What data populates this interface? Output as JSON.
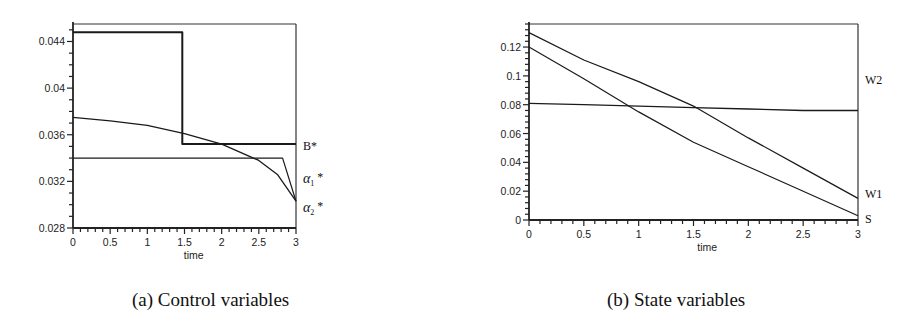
{
  "figures": {
    "a": {
      "caption": "(a) Control variables"
    },
    "b": {
      "caption": "(b) State variables"
    }
  },
  "chart_data": [
    {
      "type": "line",
      "title": "(a) Control variables",
      "xlabel": "time",
      "ylabel": "",
      "xlim": [
        0,
        3
      ],
      "ylim": [
        0.028,
        0.0455
      ],
      "xticks": [
        "0",
        "0.5",
        "1",
        "1.5",
        "2",
        "2.5",
        "3"
      ],
      "yticks": [
        "0.028",
        "0.032",
        "0.036",
        "0.04",
        "0.044"
      ],
      "grid": false,
      "legend_position": "inline-right",
      "series": [
        {
          "name": "B*",
          "label": "B*",
          "x": [
            0,
            1.47,
            1.47,
            3
          ],
          "values": [
            0.0448,
            0.0448,
            0.0352,
            0.0352
          ]
        },
        {
          "name": "α1*",
          "label": "α1 *",
          "x": [
            0,
            0.5,
            1,
            1.5,
            2,
            2.5,
            2.82,
            3
          ],
          "values": [
            0.034,
            0.034,
            0.034,
            0.034,
            0.034,
            0.034,
            0.034,
            0.0303
          ]
        },
        {
          "name": "α2*",
          "label": "α2 *",
          "x": [
            0,
            0.5,
            1,
            1.5,
            2,
            2.5,
            2.75,
            3
          ],
          "values": [
            0.0375,
            0.0372,
            0.0368,
            0.0361,
            0.0352,
            0.0338,
            0.0326,
            0.0303
          ]
        }
      ]
    },
    {
      "type": "line",
      "title": "(b) State variables",
      "xlabel": "time",
      "ylabel": "",
      "xlim": [
        0,
        3
      ],
      "ylim": [
        0,
        0.136
      ],
      "xticks": [
        "0",
        "0.5",
        "1",
        "1.5",
        "2",
        "2.5",
        "3"
      ],
      "yticks": [
        "0",
        "0.02",
        "0.04",
        "0.06",
        "0.08",
        "0.1",
        "0.12"
      ],
      "grid": false,
      "legend_position": "inline-right",
      "series": [
        {
          "name": "W2",
          "label": "W2",
          "x": [
            0,
            0.5,
            1,
            1.5,
            2,
            2.5,
            3
          ],
          "values": [
            0.081,
            0.08,
            0.079,
            0.078,
            0.077,
            0.076,
            0.076
          ]
        },
        {
          "name": "W1",
          "label": "W1",
          "x": [
            0,
            0.5,
            1,
            1.5,
            2,
            2.5,
            3
          ],
          "values": [
            0.13,
            0.111,
            0.096,
            0.079,
            0.057,
            0.036,
            0.015
          ]
        },
        {
          "name": "S",
          "label": "S",
          "x": [
            0,
            0.5,
            1,
            1.5,
            2,
            2.5,
            3
          ],
          "values": [
            0.12,
            0.098,
            0.075,
            0.054,
            0.037,
            0.02,
            0.003
          ]
        }
      ]
    }
  ]
}
